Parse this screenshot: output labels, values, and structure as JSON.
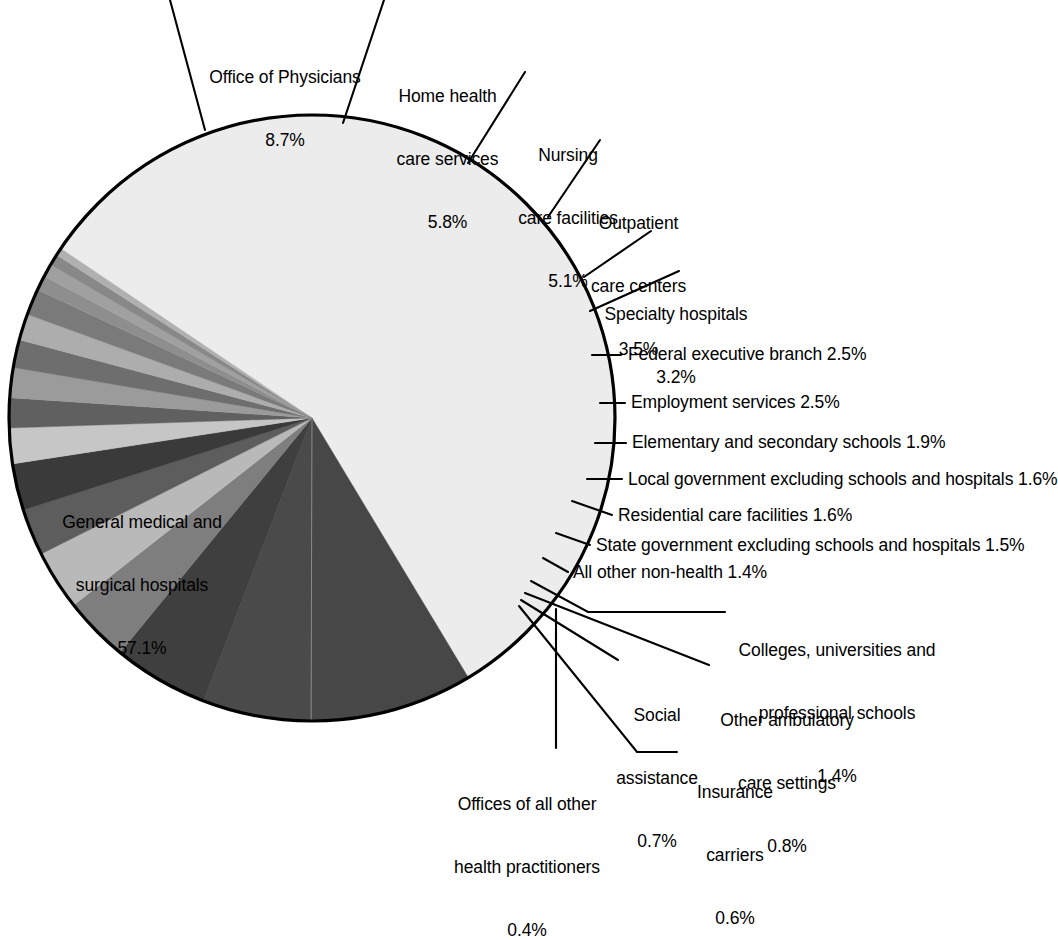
{
  "chart_data": {
    "type": "pie",
    "title": "",
    "subtitle": "",
    "xlabel": "",
    "ylabel": "",
    "legend_position": "none",
    "grid": false,
    "units": "percent",
    "start_angle_deg": -56,
    "direction": "clockwise",
    "center": {
      "x": 312,
      "y": 418
    },
    "radius": 303,
    "categories": [
      "General medical and surgical hospitals",
      "Office of Physicians",
      "Home health care services",
      "Nursing care facilities",
      "Outpatient care centers",
      "Specialty hospitals",
      "Federal executive branch",
      "Employment services",
      "Elementary and secondary schools",
      "Local government excluding schools and hospitals",
      "Residential care facilities",
      "State government excluding schools and hospitals",
      "All other non-health",
      "Colleges, universities and professional schools",
      "Other ambulatory care settings",
      "Social assistance",
      "Insurance carriers",
      "Offices of all other health practitioners"
    ],
    "values": [
      57.1,
      8.7,
      5.8,
      5.1,
      3.5,
      3.2,
      2.5,
      2.5,
      1.9,
      1.6,
      1.6,
      1.5,
      1.4,
      1.4,
      0.8,
      0.7,
      0.6,
      0.4
    ],
    "value_labels": [
      "57.1%",
      "8.7%",
      "5.8%",
      "5.1%",
      "3.5%",
      "3.2%",
      "2.5%",
      "2.5%",
      "1.9%",
      "1.6%",
      "1.6%",
      "1.5%",
      "1.4%",
      "1.4%",
      "0.8%",
      "0.7%",
      "0.6%",
      "0.4%"
    ],
    "slice_colors": [
      "#ececec",
      "#474747",
      "#4a4a4a",
      "#3f3f3f",
      "#7e7e7e",
      "#b9b9b9",
      "#5d5d5d",
      "#3a3a3a",
      "#c6c6c6",
      "#606060",
      "#9b9b9b",
      "#6e6e6e",
      "#adadad",
      "#7a7a7a",
      "#8e8e8e",
      "#a0a0a0",
      "#888888",
      "#b0b0b0"
    ],
    "outline_color": "#000000"
  },
  "labels": [
    {
      "id": "office-of-physicians",
      "name": "Office of Physicians",
      "pct": "8.7%",
      "lines": [
        "Office of Physicians",
        "8.7%"
      ]
    },
    {
      "id": "home-health-care",
      "name": "Home health care services",
      "pct": "5.8%",
      "lines": [
        "Home health",
        "care services",
        "5.8%"
      ]
    },
    {
      "id": "nursing-care",
      "name": "Nursing care facilities",
      "pct": "5.1%",
      "lines": [
        "Nursing",
        "care facilities",
        "5.1%"
      ]
    },
    {
      "id": "outpatient-care",
      "name": "Outpatient care centers",
      "pct": "3.5%",
      "lines": [
        "Outpatient",
        "care centers",
        "3.5%"
      ]
    },
    {
      "id": "specialty-hospitals",
      "name": "Specialty hospitals",
      "pct": "3.2%",
      "lines": [
        "Specialty hospitals",
        "3.2%"
      ]
    },
    {
      "id": "federal-executive",
      "name": "Federal executive branch",
      "pct": "2.5%",
      "lines": [
        "Federal executive branch 2.5%"
      ]
    },
    {
      "id": "employment-services",
      "name": "Employment services",
      "pct": "2.5%",
      "lines": [
        "Employment services 2.5%"
      ]
    },
    {
      "id": "elementary-secondary",
      "name": "Elementary and secondary schools",
      "pct": "1.9%",
      "lines": [
        "Elementary and secondary schools 1.9%"
      ]
    },
    {
      "id": "local-government",
      "name": "Local government excluding schools and hospitals",
      "pct": "1.6%",
      "lines": [
        "Local government excluding schools and hospitals 1.6%"
      ]
    },
    {
      "id": "residential-care",
      "name": "Residential care facilities",
      "pct": "1.6%",
      "lines": [
        "Residential care facilities 1.6%"
      ]
    },
    {
      "id": "state-government",
      "name": "State government excluding schools and hospitals",
      "pct": "1.5%",
      "lines": [
        "State government excluding schools and hospitals 1.5%"
      ]
    },
    {
      "id": "all-other-non-health",
      "name": "All other non-health",
      "pct": "1.4%",
      "lines": [
        "All other non-health 1.4%"
      ]
    },
    {
      "id": "colleges-universities",
      "name": "Colleges, universities and professional schools",
      "pct": "1.4%",
      "lines": [
        "Colleges, universities and",
        "professional schools",
        "1.4%"
      ]
    },
    {
      "id": "other-ambulatory",
      "name": "Other ambulatory care settings",
      "pct": "0.8%",
      "lines": [
        "Other ambulatory",
        "care settings",
        "0.8%"
      ]
    },
    {
      "id": "social-assistance",
      "name": "Social assistance",
      "pct": "0.7%",
      "lines": [
        "Social",
        "assistance",
        "0.7%"
      ]
    },
    {
      "id": "insurance-carriers",
      "name": "Insurance carriers",
      "pct": "0.6%",
      "lines": [
        "Insurance",
        "carriers",
        "0.6%"
      ]
    },
    {
      "id": "offices-other-health",
      "name": "Offices of all other health practitioners",
      "pct": "0.4%",
      "lines": [
        "Offices of all other",
        "health practitioners",
        "0.4%"
      ]
    },
    {
      "id": "general-medical",
      "name": "General medical and surgical hospitals",
      "pct": "57.1%",
      "lines": [
        "General medical and",
        "surgical hospitals",
        "57.1%"
      ]
    }
  ],
  "text": {
    "general_medical_l1": "General medical and",
    "general_medical_l2": "surgical hospitals",
    "general_medical_l3": "57.1%",
    "office_physicians_l1": "Office of Physicians",
    "office_physicians_l2": "8.7%",
    "home_health_l1": "Home health",
    "home_health_l2": "care services",
    "home_health_l3": "5.8%",
    "nursing_l1": "Nursing",
    "nursing_l2": "care facilities",
    "nursing_l3": "5.1%",
    "outpatient_l1": "Outpatient",
    "outpatient_l2": "care centers",
    "outpatient_l3": "3.5%",
    "specialty_l1": "Specialty hospitals",
    "specialty_l2": "3.2%",
    "federal": "Federal executive branch 2.5%",
    "employment": "Employment services 2.5%",
    "elementary": "Elementary and secondary schools 1.9%",
    "local_gov": "Local government excluding schools and hospitals 1.6%",
    "residential": "Residential care facilities 1.6%",
    "state_gov": "State government excluding schools and hospitals 1.5%",
    "all_other": "All other non-health 1.4%",
    "colleges_l1": "Colleges, universities and",
    "colleges_l2": "professional schools",
    "colleges_l3": "1.4%",
    "ambulatory_l1": "Other ambulatory",
    "ambulatory_l2": "care settings",
    "ambulatory_l3": "0.8%",
    "social_l1": "Social",
    "social_l2": "assistance",
    "social_l3": "0.7%",
    "insurance_l1": "Insurance",
    "insurance_l2": "carriers",
    "insurance_l3": "0.6%",
    "offices_l1": "Offices of all other",
    "offices_l2": "health practitioners",
    "offices_l3": "0.4%"
  }
}
